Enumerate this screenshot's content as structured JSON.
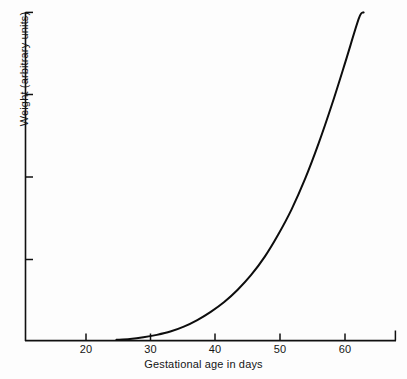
{
  "chart_data": {
    "type": "line",
    "title": "",
    "subtitle": "",
    "xlabel": "Gestational age in days",
    "ylabel": "Weight (arbitrary units)",
    "xlim": [
      12.5,
      67.5
    ],
    "ylim": [
      0,
      4
    ],
    "grid": false,
    "legend": null,
    "x_ticks": [
      20,
      30,
      40,
      50,
      60
    ],
    "x_tick_labels": [
      "20",
      "30",
      "40",
      "50",
      "60"
    ],
    "y_ticks": [
      1,
      2,
      3,
      4
    ],
    "y_tick_labels": [
      "",
      "",
      "",
      ""
    ],
    "annotations": [],
    "series": [
      {
        "name": "Fetal weight",
        "x": [
          26,
          28,
          30,
          32,
          34,
          36,
          38,
          40,
          42,
          44,
          46,
          48,
          50,
          52,
          54,
          56,
          58,
          60,
          62,
          62.7
        ],
        "y": [
          0.01,
          0.02,
          0.04,
          0.07,
          0.11,
          0.17,
          0.25,
          0.35,
          0.47,
          0.62,
          0.8,
          1.02,
          1.29,
          1.6,
          1.97,
          2.4,
          2.88,
          3.4,
          3.93,
          4.0
        ]
      }
    ]
  },
  "axes": {
    "x_axis_name": "gestational-age-axis",
    "y_axis_name": "weight-axis"
  }
}
